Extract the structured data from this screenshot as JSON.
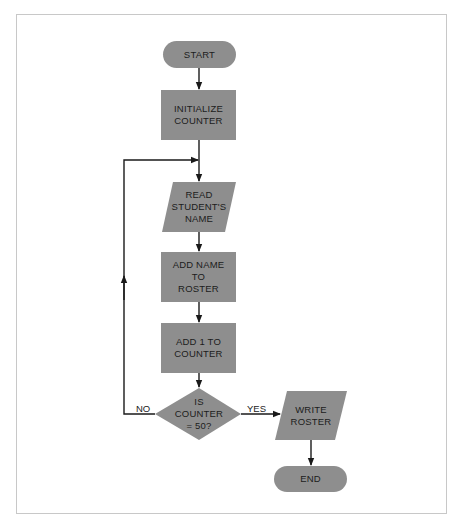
{
  "diagram": {
    "type": "flowchart",
    "colors": {
      "shape_fill": "#8e8e8e",
      "line": "#1a1a1a",
      "text": "#1c1c1c",
      "frame": "#c8c8c8"
    },
    "nodes": [
      {
        "id": "start",
        "shape": "terminator",
        "label": "START"
      },
      {
        "id": "init",
        "shape": "process",
        "label": "INITIALIZE\nCOUNTER"
      },
      {
        "id": "read",
        "shape": "input-output",
        "label": "READ\nSTUDENT'S\nNAME"
      },
      {
        "id": "add_name",
        "shape": "process",
        "label": "ADD NAME\nTO\nROSTER"
      },
      {
        "id": "add_one",
        "shape": "process",
        "label": "ADD 1 TO\nCOUNTER"
      },
      {
        "id": "decision",
        "shape": "decision",
        "label": "IS\nCOUNTER\n= 50?"
      },
      {
        "id": "write",
        "shape": "input-output",
        "label": "WRITE\nROSTER"
      },
      {
        "id": "end",
        "shape": "terminator",
        "label": "END"
      }
    ],
    "edges": [
      {
        "from": "start",
        "to": "init",
        "label": ""
      },
      {
        "from": "init",
        "to": "read",
        "label": ""
      },
      {
        "from": "read",
        "to": "add_name",
        "label": ""
      },
      {
        "from": "add_name",
        "to": "add_one",
        "label": ""
      },
      {
        "from": "add_one",
        "to": "decision",
        "label": ""
      },
      {
        "from": "decision",
        "to": "read",
        "label": "NO"
      },
      {
        "from": "decision",
        "to": "write",
        "label": "YES"
      },
      {
        "from": "write",
        "to": "end",
        "label": ""
      }
    ]
  },
  "labels": {
    "start": "START",
    "init": "INITIALIZE\nCOUNTER",
    "read": "READ\nSTUDENT'S\nNAME",
    "add_name": "ADD NAME\nTO\nROSTER",
    "add_one": "ADD 1 TO\nCOUNTER",
    "decision": "IS\nCOUNTER\n= 50?",
    "write": "WRITE\nROSTER",
    "end": "END",
    "no": "NO",
    "yes": "YES"
  }
}
